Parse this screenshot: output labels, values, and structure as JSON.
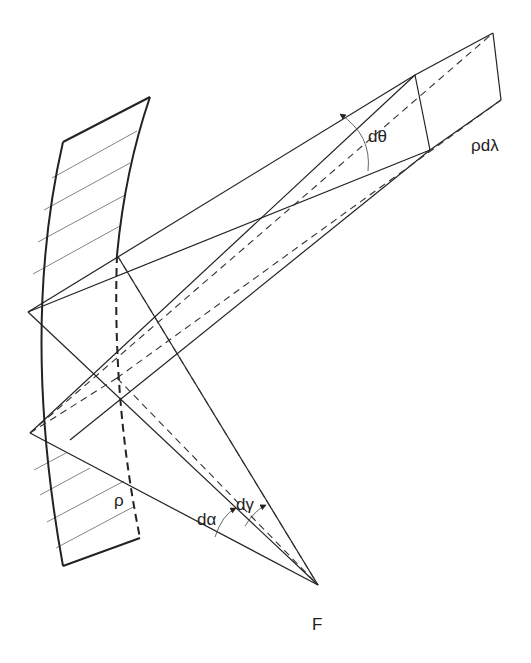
{
  "figure": {
    "labels": {
      "dtheta": "dθ",
      "rho_dlambda": "ρdλ",
      "rho": "ρ",
      "dalpha": "dα",
      "dgamma": "dγ",
      "focus": "F"
    },
    "colors": {
      "line": "#222222",
      "hatch": "#777777",
      "background": "#ffffff"
    }
  }
}
